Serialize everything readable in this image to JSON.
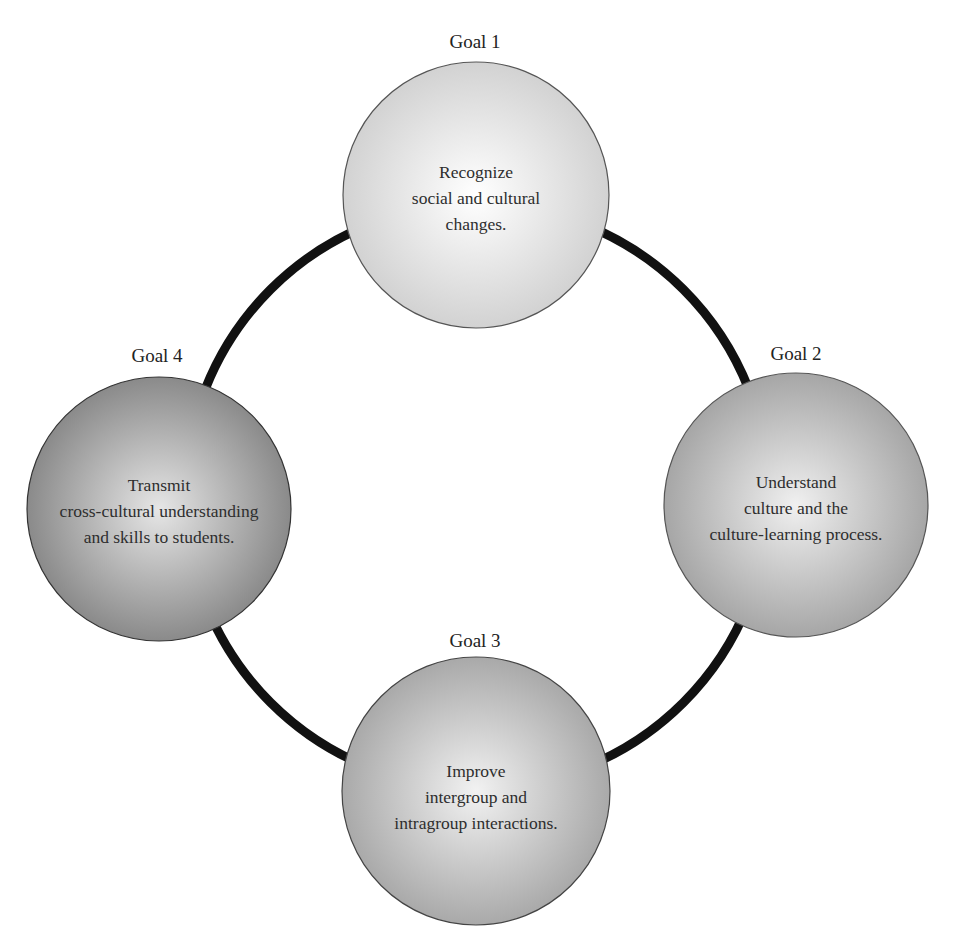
{
  "diagram": {
    "ring": {
      "cx": 477,
      "cy": 496,
      "r": 292,
      "stroke": "#111111",
      "stroke_width": 9
    },
    "goals": [
      {
        "label": "Goal 1",
        "lines": [
          "Recognize",
          "social and cultural",
          "changes."
        ],
        "cx": 476,
        "cy": 195,
        "r": 133,
        "fill_center": "#ffffff",
        "fill_edge": "#d2d2d2",
        "label_x": 475,
        "label_y": 32
      },
      {
        "label": "Goal 2",
        "lines": [
          "Understand",
          "culture and the",
          "culture-learning process."
        ],
        "cx": 796,
        "cy": 505,
        "r": 132,
        "fill_center": "#f0f0f0",
        "fill_edge": "#a6a6a6",
        "label_x": 796,
        "label_y": 344
      },
      {
        "label": "Goal 3",
        "lines": [
          "Improve",
          "intergroup and",
          "intragroup interactions."
        ],
        "cx": 476,
        "cy": 791,
        "r": 134,
        "fill_center": "#f2f2f2",
        "fill_edge": "#a9a9a9",
        "label_x": 475,
        "label_y": 631
      },
      {
        "label": "Goal 4",
        "lines": [
          "Transmit",
          "cross-cultural understanding",
          "and skills to students."
        ],
        "cx": 159,
        "cy": 509,
        "r": 132,
        "fill_center": "#e6e6e6",
        "fill_edge": "#8a8a8a",
        "label_x": 157,
        "label_y": 346
      }
    ]
  }
}
